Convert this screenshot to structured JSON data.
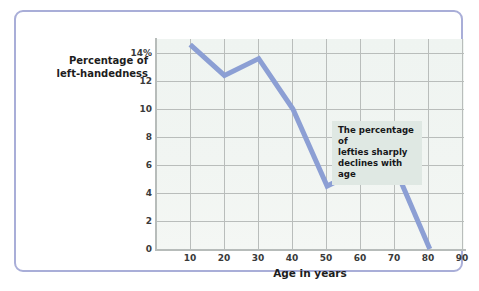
{
  "chart_data": {
    "type": "line",
    "title": "",
    "xlabel": "Age in years",
    "ylabel": "Percentage of left-handedness",
    "ylabel_line1": "Percentage of",
    "ylabel_line2": "left-handedness",
    "x": [
      10,
      20,
      30,
      40,
      50,
      60,
      70,
      80
    ],
    "values": [
      14.6,
      12.4,
      13.6,
      10.0,
      4.5,
      5.7,
      5.7,
      0.0
    ],
    "series": [
      {
        "name": "Percentage of left-handedness",
        "values": [
          14.6,
          12.4,
          13.6,
          10.0,
          4.5,
          5.7,
          5.7,
          0.0
        ]
      }
    ],
    "xlim": [
      0,
      90
    ],
    "ylim": [
      0,
      15
    ],
    "xticks": [
      10,
      20,
      30,
      40,
      50,
      60,
      70,
      80,
      90
    ],
    "xtick_labels": [
      "10",
      "20",
      "30",
      "40",
      "50",
      "60",
      "70",
      "80",
      "90"
    ],
    "yticks": [
      0,
      2,
      4,
      6,
      8,
      10,
      12,
      14
    ],
    "ytick_labels": [
      "0",
      "2",
      "4",
      "6",
      "8",
      "10",
      "12",
      "14%"
    ],
    "grid": true,
    "legend": "none",
    "annotations": [
      {
        "text": "The percentage of lefties sharply declines with age",
        "line1": "The percentage of",
        "line2": "lefties sharply",
        "line3": "declines with age"
      }
    ],
    "colors": {
      "line": "#8c9fd4",
      "plot_background": "#eff4f1",
      "gridline": "#b9bdbb",
      "axis": "#b7bcba",
      "frame_border": "#a9aed8",
      "annotation_background": "#dfe8e3",
      "text": "#1d1d1d"
    }
  }
}
